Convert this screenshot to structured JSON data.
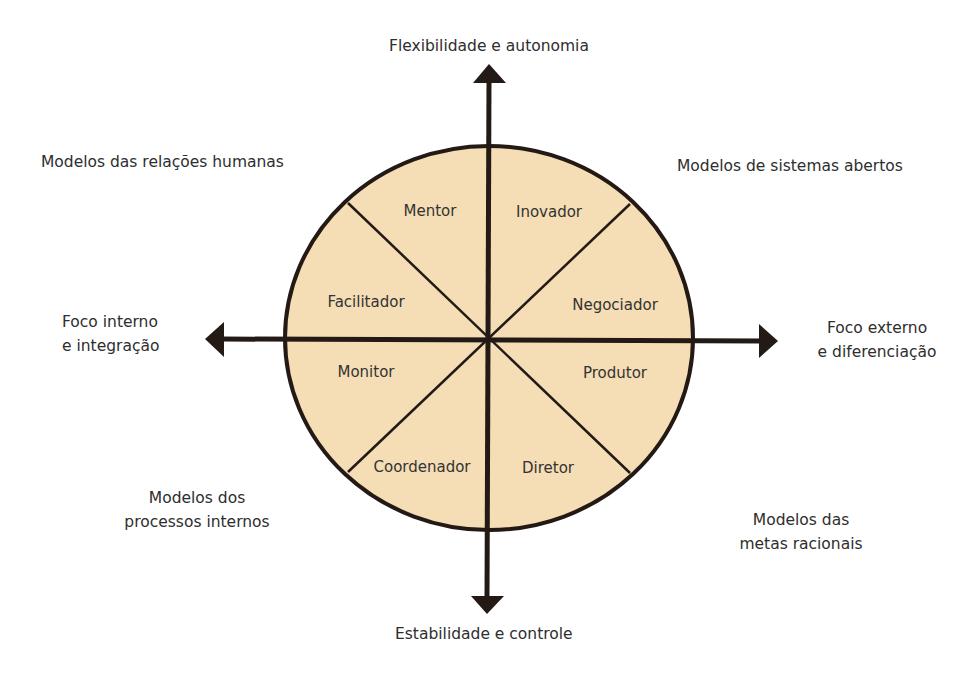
{
  "diagram": {
    "type": "competing-values-framework",
    "colors": {
      "fill": "#F5DDB5",
      "stroke": "#231a15",
      "text": "#2e2e2e"
    },
    "axes": {
      "top": "Flexibilidade e autonomia",
      "bottom": "Estabilidade e controle",
      "left": {
        "line1": "Foco interno",
        "line2": "e integração"
      },
      "right": {
        "line1": "Foco externo",
        "line2": "e diferenciação"
      }
    },
    "quadrants": {
      "top_left": {
        "line1": "Modelos das relações humanas"
      },
      "top_right": {
        "line1": "Modelos de sistemas abertos"
      },
      "bottom_left": {
        "line1": "Modelos dos",
        "line2": "processos internos"
      },
      "bottom_right": {
        "line1": "Modelos das",
        "line2": "metas racionais"
      }
    },
    "roles": [
      {
        "name": "Mentor"
      },
      {
        "name": "Inovador"
      },
      {
        "name": "Facilitador"
      },
      {
        "name": "Negociador"
      },
      {
        "name": "Monitor"
      },
      {
        "name": "Produtor"
      },
      {
        "name": "Coordenador"
      },
      {
        "name": "Diretor"
      }
    ]
  }
}
